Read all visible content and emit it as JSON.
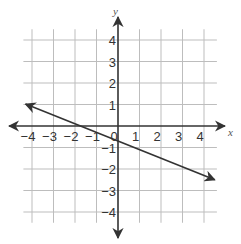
{
  "chart_data": {
    "type": "line",
    "title": "",
    "xlabel": "x",
    "ylabel": "y",
    "xlim": [
      -4.6,
      4.9
    ],
    "ylim": [
      -4.6,
      5.0
    ],
    "grid": true,
    "x_ticks": [
      -4,
      -3,
      -2,
      -1,
      0,
      1,
      2,
      3,
      4
    ],
    "y_ticks": [
      -4,
      -3,
      -2,
      -1,
      1,
      2,
      3,
      4
    ],
    "x_tick_labels": [
      "−4",
      "−3",
      "−2",
      "−1",
      "0",
      "1",
      "2",
      "3",
      "4"
    ],
    "y_tick_labels": [
      "−4",
      "−3",
      "−2",
      "−1",
      "1",
      "2",
      "3",
      "4"
    ],
    "series": [
      {
        "name": "line",
        "slope": -0.4,
        "intercept": -0.7,
        "x": [
          -4.3,
          4.5
        ],
        "y": [
          1.02,
          -2.5
        ],
        "arrows_both_ends": true,
        "color": "#333333"
      }
    ],
    "legend": null
  },
  "colors": {
    "grid": "#bdbdbd",
    "axis": "#333333",
    "line": "#333333"
  }
}
